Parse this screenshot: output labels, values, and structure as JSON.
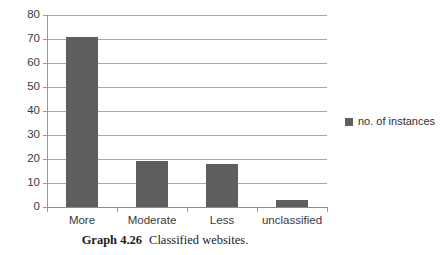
{
  "chart_data": {
    "type": "bar",
    "title": "",
    "subtitle": "",
    "xlabel": "",
    "ylabel": "",
    "categories": [
      "More",
      "Moderate",
      "Less",
      "unclassified"
    ],
    "values": [
      71,
      19,
      18,
      3
    ],
    "series": [
      {
        "name": "no. of instances",
        "values": [
          71,
          19,
          18,
          3
        ]
      }
    ],
    "ylim": [
      0,
      80
    ],
    "yticks": [
      0,
      10,
      20,
      30,
      40,
      50,
      60,
      70,
      80
    ],
    "ytick_labels": [
      "0",
      "10",
      "20",
      "30",
      "40",
      "50",
      "60",
      "70",
      "80"
    ],
    "grid": "horizontal",
    "legend_position": "right",
    "bar_color": "#5e5e5e",
    "gridline_color": "#a9a9a9"
  },
  "legend": {
    "entries": [
      {
        "label": "no. of instances",
        "color": "#5e5e5e",
        "swatch": "square-swatch-icon"
      }
    ]
  },
  "caption": {
    "label": "Graph 4.26",
    "text": "Classified websites."
  }
}
